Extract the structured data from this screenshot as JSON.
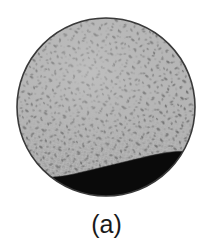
{
  "figure": {
    "caption": "(a)",
    "label_name": "panel-a",
    "background_color": "#ffffff",
    "specimen": {
      "shape": "circle",
      "center_x": 106,
      "center_y": 107,
      "radius": 89,
      "outline_color": "#3a3a3a",
      "outline_width": 1.6,
      "regions": [
        {
          "name": "porous-gray-region",
          "description": "speckled light gray porous foam region occupying upper portion of circular cross-section",
          "fill_color": "#b6b6b6",
          "speckle_color": "#6e6e6e",
          "area_fraction": 0.78
        },
        {
          "name": "solid-black-region",
          "description": "solid black dense region occupying lower portion of circular cross-section",
          "fill_color": "#0a0a0a",
          "area_fraction": 0.22
        }
      ],
      "interface": {
        "name": "gray-black-interface",
        "description": "wavy boundary between porous gray region and solid black region, lower on the left, rising toward the right",
        "left_y": 176,
        "mid_y": 161,
        "right_y": 152
      }
    }
  }
}
